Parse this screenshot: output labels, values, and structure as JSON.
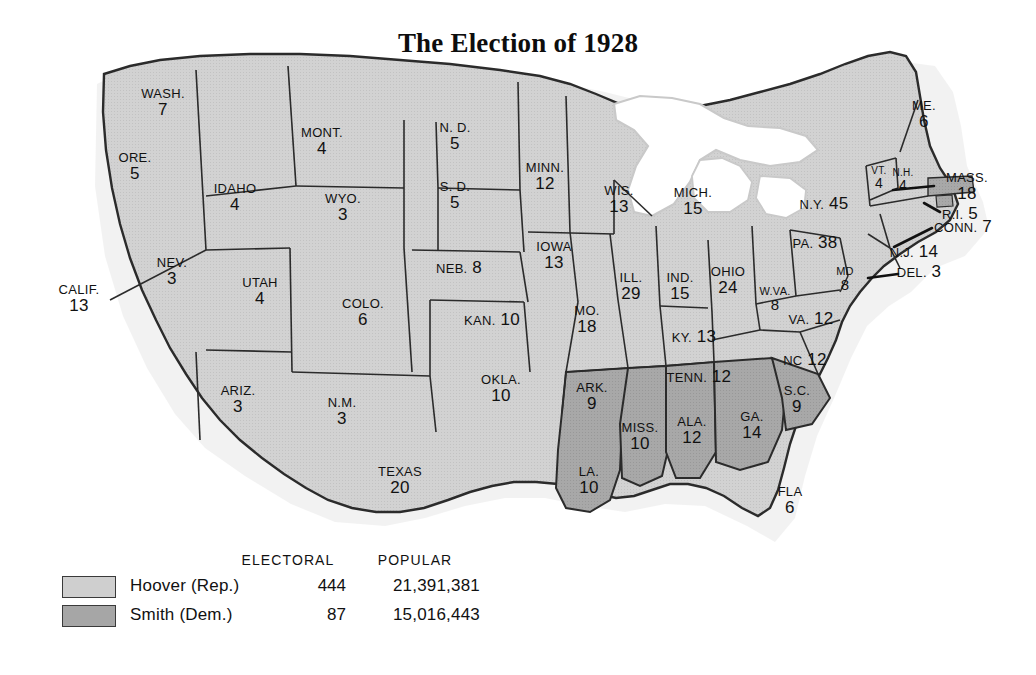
{
  "title": "The Election of 1928",
  "colors": {
    "hoover_fill": "#cfcfcf",
    "smith_fill": "#a6a6a6",
    "border": "#2b2b2b",
    "water": "#ffffff",
    "lake_halo": "#cfcfcf",
    "text": "#111111",
    "background": "#ffffff"
  },
  "legend": {
    "header_electoral": "ELECTORAL",
    "header_popular": "POPULAR",
    "rows": [
      {
        "candidate": "Hoover (Rep.)",
        "electoral": "444",
        "popular": "21,391,381",
        "swatch": "hoover_fill"
      },
      {
        "candidate": "Smith (Dem.)",
        "electoral": "87",
        "popular": "15,016,443",
        "swatch": "smith_fill"
      }
    ]
  },
  "map": {
    "states": [
      {
        "id": "wash",
        "name": "WASH.",
        "votes": "7",
        "winner": "hoover",
        "x": 163,
        "y": 103,
        "style": "stack"
      },
      {
        "id": "ore",
        "name": "ORE.",
        "votes": "5",
        "winner": "hoover",
        "x": 135,
        "y": 167,
        "style": "stack"
      },
      {
        "id": "calif",
        "name": "CALIF.",
        "votes": "13",
        "winner": "hoover",
        "x": 79,
        "y": 299,
        "style": "stack"
      },
      {
        "id": "idaho",
        "name": "IDAHO",
        "votes": "4",
        "winner": "hoover",
        "x": 235,
        "y": 198,
        "style": "stack"
      },
      {
        "id": "nev",
        "name": "NEV.",
        "votes": "3",
        "winner": "hoover",
        "x": 172,
        "y": 272,
        "style": "stack"
      },
      {
        "id": "mont",
        "name": "MONT.",
        "votes": "4",
        "winner": "hoover",
        "x": 322,
        "y": 142,
        "style": "stack"
      },
      {
        "id": "wyo",
        "name": "WYO.",
        "votes": "3",
        "winner": "hoover",
        "x": 343,
        "y": 208,
        "style": "stack"
      },
      {
        "id": "utah",
        "name": "UTAH",
        "votes": "4",
        "winner": "hoover",
        "x": 260,
        "y": 292,
        "style": "stack"
      },
      {
        "id": "ariz",
        "name": "ARIZ.",
        "votes": "3",
        "winner": "hoover",
        "x": 238,
        "y": 400,
        "style": "stack"
      },
      {
        "id": "nm",
        "name": "N.M.",
        "votes": "3",
        "winner": "hoover",
        "x": 342,
        "y": 412,
        "style": "stack"
      },
      {
        "id": "colo",
        "name": "COLO.",
        "votes": "6",
        "winner": "hoover",
        "x": 363,
        "y": 313,
        "style": "stack"
      },
      {
        "id": "nd",
        "name": "N. D.",
        "votes": "5",
        "winner": "hoover",
        "x": 455,
        "y": 137,
        "style": "stack"
      },
      {
        "id": "sd",
        "name": "S. D.",
        "votes": "5",
        "winner": "hoover",
        "x": 455,
        "y": 196,
        "style": "stack"
      },
      {
        "id": "neb",
        "name": "NEB.",
        "votes": "8",
        "winner": "hoover",
        "x": 459,
        "y": 268,
        "style": "inline"
      },
      {
        "id": "kan",
        "name": "KAN.",
        "votes": "10",
        "winner": "hoover",
        "x": 492,
        "y": 320,
        "style": "inline"
      },
      {
        "id": "okla",
        "name": "OKLA.",
        "votes": "10",
        "winner": "hoover",
        "x": 501,
        "y": 389,
        "style": "stack"
      },
      {
        "id": "texas",
        "name": "TEXAS",
        "votes": "20",
        "winner": "hoover",
        "x": 400,
        "y": 481,
        "style": "stack"
      },
      {
        "id": "minn",
        "name": "MINN.",
        "votes": "12",
        "winner": "hoover",
        "x": 545,
        "y": 177,
        "style": "stack"
      },
      {
        "id": "iowa",
        "name": "IOWA",
        "votes": "13",
        "winner": "hoover",
        "x": 554,
        "y": 256,
        "style": "stack"
      },
      {
        "id": "mo",
        "name": "MO.",
        "votes": "18",
        "winner": "hoover",
        "x": 587,
        "y": 320,
        "style": "stack"
      },
      {
        "id": "ark",
        "name": "ARK.",
        "votes": "9",
        "winner": "smith",
        "x": 592,
        "y": 397,
        "style": "stack"
      },
      {
        "id": "la",
        "name": "LA.",
        "votes": "10",
        "winner": "smith",
        "x": 589,
        "y": 481,
        "style": "stack"
      },
      {
        "id": "wis",
        "name": "WIS.",
        "votes": "13",
        "winner": "hoover",
        "x": 619,
        "y": 200,
        "style": "stack"
      },
      {
        "id": "ill",
        "name": "ILL.",
        "votes": "29",
        "winner": "hoover",
        "x": 631,
        "y": 287,
        "style": "stack"
      },
      {
        "id": "miss",
        "name": "MISS.",
        "votes": "10",
        "winner": "smith",
        "x": 640,
        "y": 437,
        "style": "stack"
      },
      {
        "id": "mich",
        "name": "MICH.",
        "votes": "15",
        "winner": "hoover",
        "x": 693,
        "y": 202,
        "style": "stack"
      },
      {
        "id": "ind",
        "name": "IND.",
        "votes": "15",
        "winner": "hoover",
        "x": 680,
        "y": 287,
        "style": "stack"
      },
      {
        "id": "ohio",
        "name": "OHIO",
        "votes": "24",
        "winner": "hoover",
        "x": 728,
        "y": 281,
        "style": "stack"
      },
      {
        "id": "ky",
        "name": "KY.",
        "votes": "13",
        "winner": "hoover",
        "x": 694,
        "y": 337,
        "style": "inline"
      },
      {
        "id": "tenn",
        "name": "TENN.",
        "votes": "12",
        "winner": "hoover",
        "x": 699,
        "y": 377,
        "style": "inline"
      },
      {
        "id": "ala",
        "name": "ALA.",
        "votes": "12",
        "winner": "smith",
        "x": 692,
        "y": 431,
        "style": "stack"
      },
      {
        "id": "ga",
        "name": "GA.",
        "votes": "14",
        "winner": "smith",
        "x": 752,
        "y": 426,
        "style": "stack"
      },
      {
        "id": "fla",
        "name": "FLA",
        "votes": "6",
        "winner": "hoover",
        "x": 790,
        "y": 501,
        "style": "stack"
      },
      {
        "id": "sc",
        "name": "S.C.",
        "votes": "9",
        "winner": "smith",
        "x": 797,
        "y": 400,
        "style": "stack"
      },
      {
        "id": "nc",
        "name": "NC",
        "votes": "12",
        "winner": "hoover",
        "x": 805,
        "y": 360,
        "style": "inline"
      },
      {
        "id": "va",
        "name": "VA.",
        "votes": "12",
        "winner": "hoover",
        "x": 811,
        "y": 319,
        "style": "inline"
      },
      {
        "id": "wva",
        "name": "W.VA.",
        "votes": "8",
        "winner": "hoover",
        "x": 775,
        "y": 300,
        "style": "small"
      },
      {
        "id": "md",
        "name": "MD",
        "votes": "8",
        "winner": "hoover",
        "x": 845,
        "y": 280,
        "style": "small"
      },
      {
        "id": "pa",
        "name": "PA.",
        "votes": "38",
        "winner": "hoover",
        "x": 815,
        "y": 243,
        "style": "inline"
      },
      {
        "id": "ny",
        "name": "N.Y.",
        "votes": "45",
        "winner": "hoover",
        "x": 824,
        "y": 204,
        "style": "inline"
      },
      {
        "id": "vt",
        "name": "VT.",
        "votes": "4",
        "winner": "hoover",
        "x": 879,
        "y": 178,
        "style": "tiny"
      },
      {
        "id": "nh",
        "name": "N.H.",
        "votes": "4",
        "winner": "hoover",
        "x": 903,
        "y": 180,
        "style": "tiny"
      },
      {
        "id": "me",
        "name": "ME.",
        "votes": "6",
        "winner": "hoover",
        "x": 924,
        "y": 115,
        "style": "stack"
      },
      {
        "id": "mass",
        "name": "MASS.",
        "votes": "18",
        "winner": "smith",
        "x": 967,
        "y": 187,
        "style": "stack"
      },
      {
        "id": "ri",
        "name": "R.I.",
        "votes": "5",
        "winner": "smith",
        "x": 960,
        "y": 214,
        "style": "inline"
      },
      {
        "id": "conn",
        "name": "CONN.",
        "votes": "7",
        "winner": "hoover",
        "x": 963,
        "y": 227,
        "style": "inline"
      },
      {
        "id": "nj",
        "name": "N.J.",
        "votes": "14",
        "winner": "hoover",
        "x": 914,
        "y": 252,
        "style": "inline"
      },
      {
        "id": "del",
        "name": "DEL.",
        "votes": "3",
        "winner": "hoover",
        "x": 919,
        "y": 272,
        "style": "inline"
      }
    ]
  }
}
